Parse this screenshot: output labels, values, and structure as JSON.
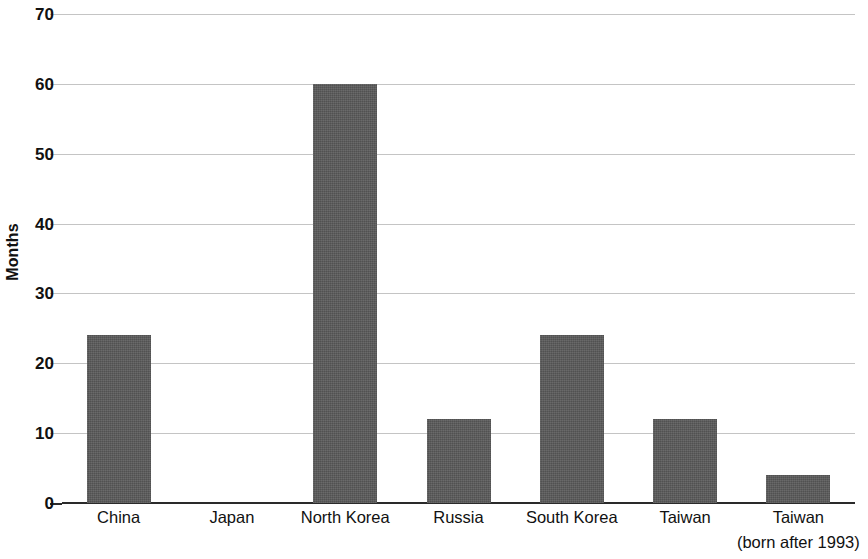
{
  "chart_data": {
    "type": "bar",
    "title": "",
    "subtitle": "",
    "xlabel": "",
    "ylabel": "Months",
    "ylim": [
      0,
      70
    ],
    "yticks": [
      0,
      10,
      20,
      30,
      40,
      50,
      60,
      70
    ],
    "ytick_labels": [
      "0",
      "10",
      "20",
      "30",
      "40",
      "50",
      "60",
      "70"
    ],
    "grid": true,
    "legend": false,
    "legend_position": "none",
    "bar_color": "#595959",
    "gridline_color": "#c4c4c4",
    "axis_color": "#2a2a2a",
    "categories": [
      "China",
      "Japan",
      "North Korea",
      "Russia",
      "South Korea",
      "Taiwan",
      "Taiwan"
    ],
    "category_sublabels": [
      "",
      "",
      "",
      "",
      "",
      "",
      "(born after 1993)"
    ],
    "values": [
      24,
      0,
      60,
      12,
      24,
      12,
      4
    ],
    "annotations": []
  }
}
